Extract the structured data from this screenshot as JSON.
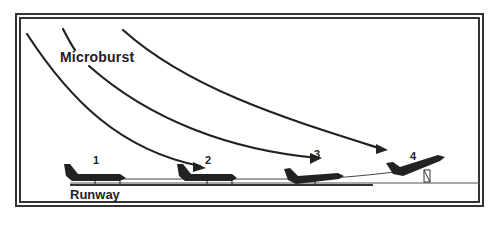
{
  "diagram": {
    "title": "Microburst",
    "runway_label": "Runway",
    "positions": [
      {
        "id": "1",
        "label": "1",
        "phase": "takeoff-roll"
      },
      {
        "id": "2",
        "label": "2",
        "phase": "headwind"
      },
      {
        "id": "3",
        "label": "3",
        "phase": "downdraft"
      },
      {
        "id": "4",
        "label": "4",
        "phase": "tailwind-liftoff"
      }
    ],
    "colors": {
      "ink": "#222222",
      "background": "#ffffff"
    }
  }
}
